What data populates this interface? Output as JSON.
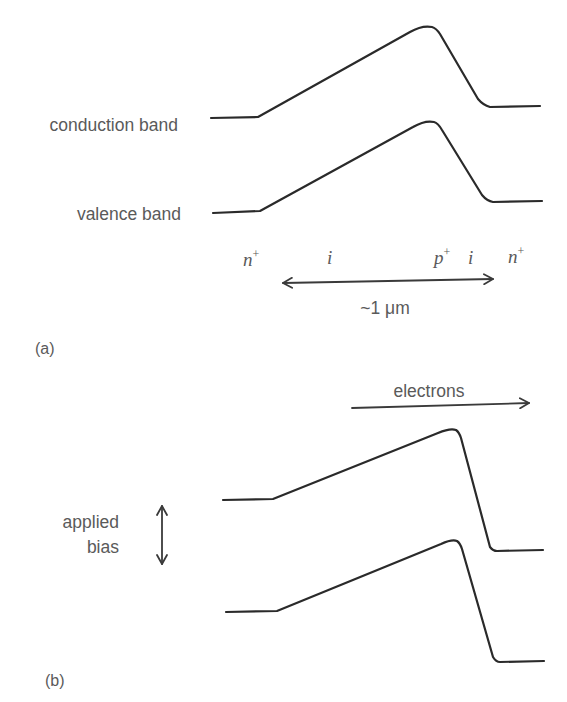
{
  "figure": {
    "panel_a": {
      "label": "(a)",
      "conduction_band_label": "conduction band",
      "valence_band_label": "valence band",
      "regions": [
        {
          "symbol": "n",
          "superscript": "+"
        },
        {
          "symbol": "i",
          "superscript": ""
        },
        {
          "symbol": "p",
          "superscript": "+"
        },
        {
          "symbol": "i",
          "superscript": ""
        },
        {
          "symbol": "n",
          "superscript": "+"
        }
      ],
      "dimension_label": "~1 μm"
    },
    "panel_b": {
      "label": "(b)",
      "electrons_label": "electrons",
      "applied_bias_line1": "applied",
      "applied_bias_line2": "bias"
    },
    "colors": {
      "line": "#2a2a2a",
      "text": "#5a5a5a",
      "background": "#ffffff"
    }
  }
}
